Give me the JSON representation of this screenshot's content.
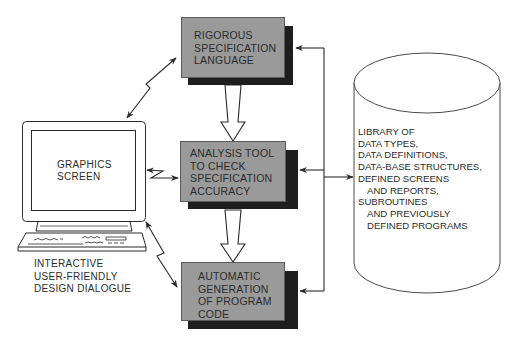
{
  "diagram": {
    "title": "",
    "colors": {
      "box_fill": "#9a9a9a",
      "box_shadow": "#1e1e1e",
      "line": "#2a2a2a",
      "background": "#ffffff"
    },
    "terminal": {
      "screen_label": [
        "GRAPHICS",
        "SCREEN"
      ],
      "caption": [
        "INTERACTIVE",
        "USER-FRIENDLY",
        "DESIGN DIALOGUE"
      ]
    },
    "process_boxes": [
      {
        "id": "spec-language",
        "lines": [
          "RIGOROUS",
          "SPECIFICATION",
          "LANGUAGE"
        ]
      },
      {
        "id": "analysis-tool",
        "lines": [
          "ANALYSIS TOOL",
          "TO CHECK",
          "SPECIFICATION",
          "ACCURACY"
        ]
      },
      {
        "id": "code-generation",
        "lines": [
          "AUTOMATIC",
          "GENERATION",
          "OF PROGRAM",
          "CODE"
        ]
      }
    ],
    "library": {
      "shape": "cylinder",
      "lines": [
        "LIBRARY OF",
        "DATA TYPES,",
        "DATA DEFINITIONS,",
        "DATA-BASE STRUCTURES,",
        "DEFINED SCREENS",
        "AND REPORTS,",
        "SUBROUTINES",
        "AND PREVIOUSLY",
        "DEFINED PROGRAMS"
      ]
    },
    "connections": [
      {
        "from": "terminal",
        "to": "spec-language",
        "style": "zigzag-bidirectional"
      },
      {
        "from": "terminal",
        "to": "analysis-tool",
        "style": "zigzag-bidirectional"
      },
      {
        "from": "terminal",
        "to": "code-generation",
        "style": "zigzag-bidirectional"
      },
      {
        "from": "spec-language",
        "to": "analysis-tool",
        "style": "hollow-arrow"
      },
      {
        "from": "analysis-tool",
        "to": "code-generation",
        "style": "hollow-arrow"
      },
      {
        "from": "library",
        "to": "spec-language",
        "style": "bus-arrow"
      },
      {
        "from": "library",
        "to": "analysis-tool",
        "style": "bus-arrow"
      },
      {
        "from": "library",
        "to": "code-generation",
        "style": "bus-arrow"
      },
      {
        "from": "bus",
        "to": "library",
        "style": "arrow"
      }
    ]
  }
}
